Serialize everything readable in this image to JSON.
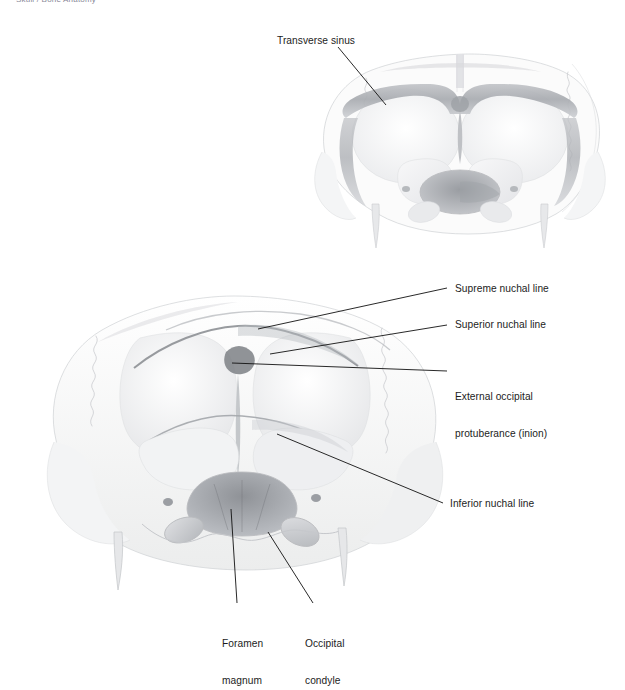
{
  "page": {
    "top_caption": "Skull / Bone Anatomy",
    "background_color": "#ffffff",
    "ink_color": "#1c1c1c",
    "width": 625,
    "height": 672
  },
  "figures": [
    {
      "id": "internal-view",
      "name": "occipital-bone-internal-view",
      "description": "Internal (endocranial) view of the occipital bone showing the grooves for the transverse sinuses"
    },
    {
      "id": "external-view",
      "name": "occipital-bone-posterior-view",
      "description": "External posterior view of the occipital bone showing the nuchal lines, inion, foramen magnum and occipital condyles"
    }
  ],
  "labels": [
    {
      "id": "transverse-sinus",
      "text": "Transverse sinus",
      "text2": "",
      "x": 277,
      "y": 35,
      "align": "left",
      "figure": "internal-view"
    },
    {
      "id": "supreme-nuchal",
      "text": "Supreme nuchal line",
      "text2": "",
      "x": 455,
      "y": 283,
      "align": "left",
      "figure": "external-view"
    },
    {
      "id": "superior-nuchal",
      "text": "Superior nuchal line",
      "text2": "",
      "x": 455,
      "y": 319,
      "align": "left",
      "figure": "external-view"
    },
    {
      "id": "external-occipital",
      "text": "External occipital",
      "text2": "protuberance (inion)",
      "x": 455,
      "y": 366,
      "align": "left",
      "figure": "external-view"
    },
    {
      "id": "inferior-nuchal",
      "text": "Inferior nuchal line",
      "text2": "",
      "x": 450,
      "y": 498,
      "align": "left",
      "figure": "external-view"
    },
    {
      "id": "foramen-magnum",
      "text": "Foramen",
      "text2": "magnum",
      "x": 222,
      "y": 613,
      "align": "left",
      "figure": "external-view"
    },
    {
      "id": "occipital-condyle",
      "text": "Occipital",
      "text2": "condyle",
      "x": 305,
      "y": 613,
      "align": "left",
      "figure": "external-view"
    }
  ],
  "leader_lines": [
    {
      "id": "leader-transverse-sinus",
      "x1": 338,
      "y1": 47,
      "x2": 386,
      "y2": 105
    },
    {
      "id": "leader-supreme-nuchal",
      "x1": 447,
      "y1": 288,
      "x2": 258,
      "y2": 329
    },
    {
      "id": "leader-superior-nuchal",
      "x1": 447,
      "y1": 325,
      "x2": 270,
      "y2": 354
    },
    {
      "id": "leader-external-occipital",
      "x1": 447,
      "y1": 371,
      "x2": 232,
      "y2": 363
    },
    {
      "id": "leader-inferior-nuchal",
      "x1": 443,
      "y1": 503,
      "x2": 277,
      "y2": 434
    },
    {
      "id": "leader-foramen-magnum",
      "x1": 237,
      "y1": 603,
      "x2": 231,
      "y2": 509
    },
    {
      "id": "leader-occipital-condyle",
      "x1": 313,
      "y1": 603,
      "x2": 268,
      "y2": 532
    }
  ]
}
